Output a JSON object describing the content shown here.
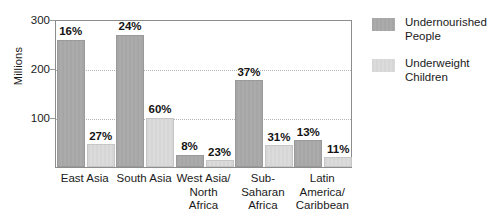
{
  "chart_data": {
    "type": "bar",
    "title": "",
    "subtitle": "",
    "xlabel": "",
    "ylabel": "Millions",
    "ylim": [
      0,
      300
    ],
    "yticks": [
      100,
      200,
      300
    ],
    "ytick_labels": [
      "100",
      "200",
      "300"
    ],
    "grid": "horizontal-dotted",
    "legend_position": "right",
    "categories": [
      "East Asia",
      "South Asia",
      "West Asia/ North Africa",
      "Sub- Saharan Africa",
      "Latin America/ Caribbean"
    ],
    "category_lines": [
      [
        "East Asia"
      ],
      [
        "South Asia"
      ],
      [
        "West Asia/",
        "North",
        "Africa"
      ],
      [
        "Sub-",
        "Saharan",
        "Africa"
      ],
      [
        "Latin",
        "America/",
        "Caribbean"
      ]
    ],
    "series": [
      {
        "name": "Undernourished People",
        "name_lines": [
          "Undernourished",
          "People"
        ],
        "color": "#a8a8a8",
        "values": [
          258,
          268,
          25,
          176,
          54
        ],
        "data_labels": [
          "16%",
          "24%",
          "8%",
          "37%",
          "13%"
        ]
      },
      {
        "name": "Underweight Children",
        "name_lines": [
          "Underweight",
          "Children"
        ],
        "color": "#d8d8d8",
        "values": [
          46,
          100,
          14,
          44,
          20
        ],
        "data_labels": [
          "27%",
          "60%",
          "23%",
          "31%",
          "11%"
        ]
      }
    ]
  },
  "axis": {
    "y_label": "Millions",
    "y_ticks": [
      "300",
      "200",
      "100"
    ]
  },
  "legend": {
    "items": [
      {
        "line1": "Undernourished",
        "line2": "People"
      },
      {
        "line1": "Underweight",
        "line2": "Children"
      }
    ]
  },
  "colors": {
    "series_dark": "#a8a8a8",
    "series_light": "#d8d8d8",
    "frame": "#8d8d8d",
    "grid": "#b4b4b4",
    "text": "#1a1a1a"
  }
}
